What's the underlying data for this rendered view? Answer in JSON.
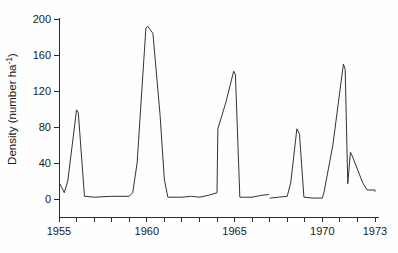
{
  "chart_data": {
    "type": "line",
    "title": "",
    "subtitle": "",
    "xlabel": "",
    "ylabel": "Density (number ha",
    "ylabel_sup": "-1",
    "ylabel_tail": ")",
    "ylabel_full": "Density (number ha⁻¹)",
    "xlim": [
      1955,
      1973
    ],
    "ylim": [
      0,
      200
    ],
    "grid": false,
    "legend": null,
    "yticks": [
      0,
      40,
      80,
      120,
      160,
      200
    ],
    "ytick_labels": [
      "0",
      "40",
      "80",
      "120",
      "160",
      "200"
    ],
    "xticks": [
      1955,
      1956,
      1957,
      1958,
      1959,
      1960,
      1961,
      1962,
      1963,
      1964,
      1965,
      1966,
      1967,
      1968,
      1969,
      1970,
      1971,
      1972,
      1973
    ],
    "xtick_labels": [
      {
        "value": 1955,
        "label": "1955"
      },
      {
        "value": 1960,
        "label": "1960"
      },
      {
        "value": 1965,
        "label": "1965"
      },
      {
        "value": 1970,
        "label": "1970"
      },
      {
        "value": 1973,
        "label": "1973"
      }
    ],
    "line_color": "#333333",
    "series": [
      {
        "name": "density",
        "segments": [
          {
            "points": [
              [
                1955.05,
                17
              ],
              [
                1955.3,
                7
              ],
              [
                1955.5,
                20
              ],
              [
                1956.0,
                99
              ],
              [
                1956.1,
                96
              ],
              [
                1956.45,
                3
              ],
              [
                1957.0,
                2
              ],
              [
                1958.0,
                3
              ],
              [
                1959.0,
                3
              ],
              [
                1959.2,
                7
              ],
              [
                1959.45,
                40
              ],
              [
                1959.95,
                190
              ],
              [
                1960.05,
                192
              ],
              [
                1960.35,
                184
              ],
              [
                1960.75,
                95
              ],
              [
                1961.0,
                22
              ],
              [
                1961.2,
                2
              ],
              [
                1962.0,
                2
              ],
              [
                1962.55,
                3
              ],
              [
                1963.0,
                2
              ],
              [
                1963.5,
                4
              ],
              [
                1964.0,
                7
              ],
              [
                1964.05,
                78
              ],
              [
                1964.5,
                107
              ],
              [
                1964.95,
                142
              ],
              [
                1965.05,
                138
              ],
              [
                1965.3,
                2
              ],
              [
                1966.0,
                2
              ],
              [
                1966.5,
                4
              ],
              [
                1966.95,
                5
              ]
            ]
          },
          {
            "points": [
              [
                1967.0,
                1
              ],
              [
                1967.5,
                2
              ],
              [
                1968.0,
                3
              ],
              [
                1968.2,
                18
              ],
              [
                1968.55,
                78
              ],
              [
                1968.7,
                72
              ],
              [
                1968.95,
                2
              ],
              [
                1969.5,
                1
              ],
              [
                1970.0,
                1
              ],
              [
                1970.1,
                8
              ],
              [
                1970.6,
                60
              ],
              [
                1971.2,
                150
              ],
              [
                1971.3,
                144
              ],
              [
                1971.45,
                17
              ],
              [
                1971.6,
                52
              ],
              [
                1971.7,
                48
              ],
              [
                1972.3,
                18
              ],
              [
                1972.55,
                10
              ],
              [
                1973.0,
                10
              ]
            ]
          },
          {
            "points": [
              [
                1972.95,
                9
              ],
              [
                1973.05,
                9
              ]
            ]
          }
        ]
      }
    ]
  }
}
